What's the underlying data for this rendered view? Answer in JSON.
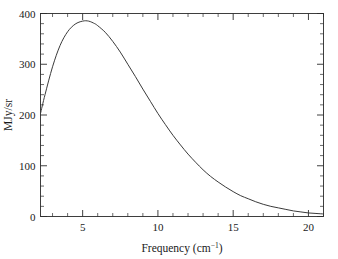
{
  "chart_data": {
    "type": "line",
    "title": "",
    "subtitle": "",
    "xlabel_text": "Frequency (cm",
    "xlabel_sup": "−1",
    "xlabel_tail": ")",
    "xlabel": "Frequency (cm^-1)",
    "ylabel": "MJy/sr",
    "xlim": [
      2.2,
      21.0
    ],
    "ylim": [
      0,
      400
    ],
    "grid": false,
    "legend": null,
    "x_ticks_major": [
      5,
      10,
      15,
      20
    ],
    "x_tick_labels": [
      "5",
      "10",
      "15",
      "20"
    ],
    "x_minor_interval": 1,
    "y_ticks_major": [
      0,
      100,
      200,
      300,
      400
    ],
    "y_tick_labels": [
      "0",
      "100",
      "200",
      "300",
      "400"
    ],
    "y_minor_interval": 20,
    "series": [
      {
        "name": "CMB blackbody spectrum",
        "color": "#3a3a3a",
        "x": [
          2.2,
          2.5,
          3.0,
          3.5,
          4.0,
          4.5,
          5.0,
          5.4,
          5.8,
          6.0,
          6.5,
          7.0,
          7.5,
          8.0,
          8.5,
          9.0,
          9.5,
          10.0,
          10.5,
          11.0,
          11.5,
          12.0,
          12.5,
          13.0,
          13.5,
          14.0,
          14.5,
          15.0,
          15.5,
          16.0,
          16.5,
          17.0,
          17.5,
          18.0,
          18.5,
          19.0,
          19.5,
          20.0,
          20.5,
          21.0
        ],
        "y": [
          203,
          240,
          295,
          337,
          364,
          379,
          385,
          385,
          380,
          376,
          363,
          345,
          324,
          300,
          276,
          251,
          227,
          203,
          181,
          160,
          141,
          123,
          107,
          92,
          79,
          68,
          58,
          49,
          41,
          35,
          29,
          24,
          20,
          17,
          14,
          11,
          9,
          7,
          6,
          5
        ]
      }
    ]
  },
  "axes": {
    "frame_color": "#2b2b2b",
    "background": "#ffffff"
  }
}
